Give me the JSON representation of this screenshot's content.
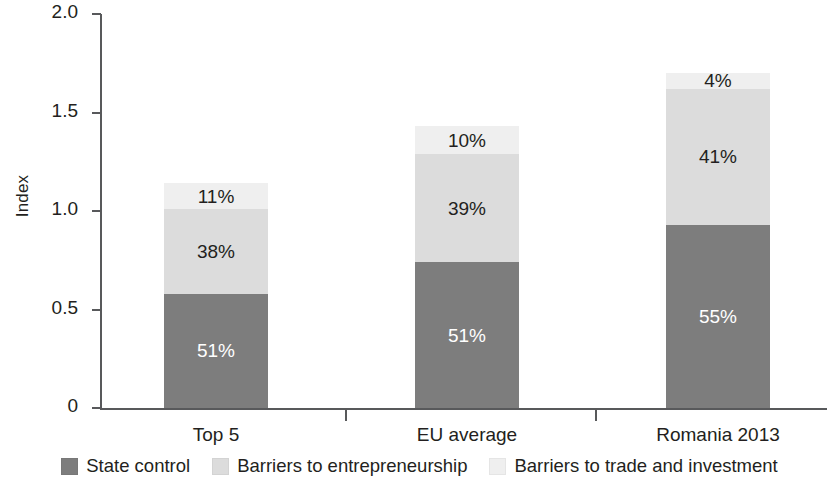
{
  "chart_data": {
    "type": "bar",
    "subtype": "stacked-bar",
    "title": "",
    "xlabel": "",
    "ylabel": "Index",
    "ylim": [
      0,
      2.0
    ],
    "yticks": [
      0,
      0.5,
      1.0,
      1.5,
      2.0
    ],
    "ytick_labels": [
      "0",
      "0.5",
      "1.0",
      "1.5",
      "2.0"
    ],
    "grid": false,
    "legend_position": "bottom",
    "categories": [
      "Top 5",
      "EU average",
      "Romania 2013"
    ],
    "series": [
      {
        "name": "State control",
        "color": "#7d7d7d",
        "values": [
          0.58,
          0.74,
          0.93
        ],
        "labels": [
          "51%",
          "51%",
          "55%"
        ]
      },
      {
        "name": "Barriers to entrepreneurship",
        "color": "#dcdcdc",
        "values": [
          0.43,
          0.55,
          0.69
        ],
        "labels": [
          "38%",
          "39%",
          "41%"
        ]
      },
      {
        "name": "Barriers to trade and investment",
        "color": "#efefef",
        "values": [
          0.13,
          0.14,
          0.08
        ],
        "labels": [
          "11%",
          "10%",
          "4%"
        ]
      }
    ],
    "totals": [
      1.14,
      1.29,
      1.7
    ]
  },
  "axis": {
    "y_title": "Index",
    "y_ticks": [
      {
        "label": "2.0",
        "value": 2.0
      },
      {
        "label": "1.5",
        "value": 1.5
      },
      {
        "label": "1.0",
        "value": 1.0
      },
      {
        "label": "0.5",
        "value": 0.5
      },
      {
        "label": "0",
        "value": 0
      }
    ],
    "x_categories": [
      {
        "label": "Top 5"
      },
      {
        "label": "EU average"
      },
      {
        "label": "Romania 2013"
      }
    ]
  },
  "legend": {
    "items": [
      {
        "label": "State control",
        "color": "#7d7d7d"
      },
      {
        "label": "Barriers to entrepreneurship",
        "color": "#dcdcdc"
      },
      {
        "label": "Barriers to trade and investment",
        "color": "#efefef"
      }
    ]
  }
}
